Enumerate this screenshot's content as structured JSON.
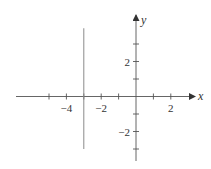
{
  "chart_data": {
    "type": "line",
    "title": "",
    "xlabel": "x",
    "ylabel": "y",
    "xlim": [
      -6,
      3
    ],
    "ylim": [
      -3.5,
      4
    ],
    "grid": false,
    "x_ticks": [
      -5,
      -4,
      -3,
      -2,
      -1,
      1,
      2
    ],
    "x_tick_labels": [
      {
        "value": -4,
        "label": "−4"
      },
      {
        "value": -2,
        "label": "−2"
      },
      {
        "value": 2,
        "label": "2"
      }
    ],
    "y_ticks": [
      -3,
      -2,
      -1,
      1,
      2,
      3
    ],
    "y_tick_labels": [
      {
        "value": 2,
        "label": "2"
      },
      {
        "value": -2,
        "label": "−2"
      }
    ],
    "series": [
      {
        "name": "x = -3",
        "x": [
          -3,
          -3
        ],
        "y": [
          3.9,
          -3.0
        ]
      }
    ],
    "colors": {
      "axis": "#555555",
      "line": "#8a8a8a",
      "text": "#333333"
    }
  }
}
